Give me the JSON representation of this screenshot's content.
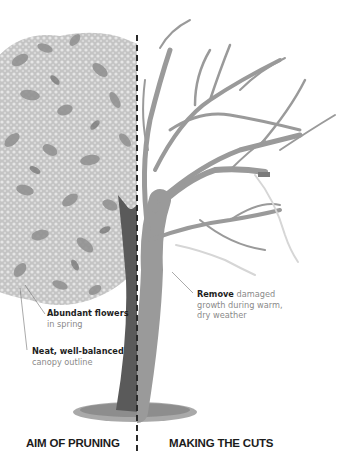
{
  "diagram": {
    "type": "pruning-illustration",
    "colors": {
      "background": "#ffffff",
      "foliage_dark": "#8c8c8c",
      "foliage_mid": "#b0b0b0",
      "flowers": "#dcdcdc",
      "trunk_left": "#5a5a5a",
      "branches_right": "#9a9a9a",
      "removed_branch": "#d6d6d6",
      "divider": "#2a2a2a",
      "ground": "#8e8e8e"
    },
    "left_panel": {
      "title": "AIM OF PRUNING",
      "annotations": [
        {
          "bold": "Abundant flowers",
          "text": "in spring"
        },
        {
          "bold": "Neat, well-balanced",
          "text": "canopy outline"
        }
      ]
    },
    "right_panel": {
      "title": "MAKING THE CUTS",
      "annotations": [
        {
          "bold": "Remove",
          "text_line1": "damaged",
          "text_line2": "growth during warm,",
          "text_line3": "dry weather"
        }
      ]
    }
  }
}
